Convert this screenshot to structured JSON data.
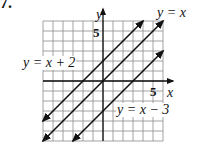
{
  "problem_number": "7.",
  "chart_data": {
    "type": "line",
    "title": "",
    "xlabel": "x",
    "ylabel": "y",
    "xlim": [
      -6,
      6
    ],
    "ylim": [
      -6,
      6
    ],
    "grid": true,
    "tick_labels": {
      "x": [
        "5"
      ],
      "y": [
        "5"
      ]
    },
    "series": [
      {
        "name": "y = x + 2",
        "slope": 1,
        "intercept": 2,
        "x": [
          -6,
          4
        ],
        "y": [
          -4,
          6
        ],
        "arrows": "both"
      },
      {
        "name": "y = x",
        "slope": 1,
        "intercept": 0,
        "x": [
          -6,
          6
        ],
        "y": [
          -6,
          6
        ],
        "arrows": "both"
      },
      {
        "name": "y = x − 3",
        "slope": 1,
        "intercept": -3,
        "x": [
          -3,
          6
        ],
        "y": [
          -6,
          3
        ],
        "arrows": "both"
      }
    ]
  },
  "labels": {
    "axis_y": "y",
    "axis_x": "x",
    "tick_y5": "5",
    "tick_x5": "5",
    "line1": "y = x + 2",
    "line2": "y = x",
    "line3": "y = x − 3"
  }
}
